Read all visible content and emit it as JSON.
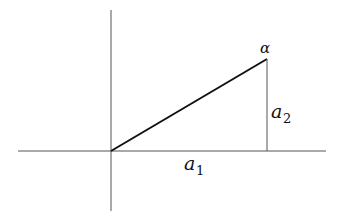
{
  "diagram": {
    "type": "vector-components",
    "labels": {
      "vector_tip": "α",
      "vertical_component": {
        "base": "a",
        "sub": "2"
      },
      "horizontal_component": {
        "base": "a",
        "sub": "1"
      }
    },
    "geometry": {
      "origin": [
        111,
        151
      ],
      "tip": [
        267,
        59
      ],
      "x_axis": {
        "from": [
          18,
          151
        ],
        "to": [
          326,
          151
        ]
      },
      "y_axis": {
        "from": [
          111,
          10
        ],
        "to": [
          111,
          211
        ]
      }
    },
    "colors": {
      "axis": "#555555",
      "vector": "#111111",
      "text": "#111111"
    }
  }
}
